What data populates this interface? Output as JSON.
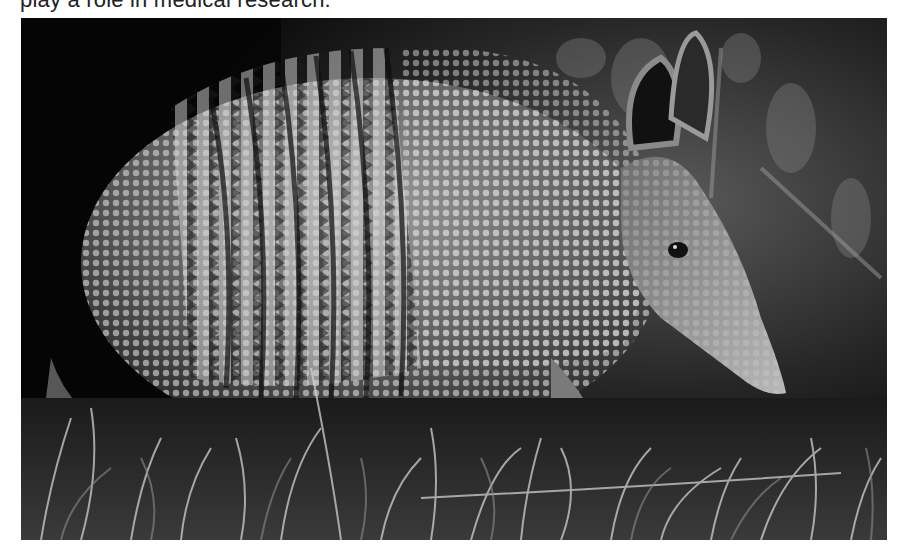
{
  "document": {
    "text_line_partial": "play a role in medical research.",
    "figure": {
      "subject": "nine-banded armadillo in grass",
      "style": "grayscale photograph",
      "alt": "Armadillo photographed in profile, foraging among grass blades"
    }
  }
}
